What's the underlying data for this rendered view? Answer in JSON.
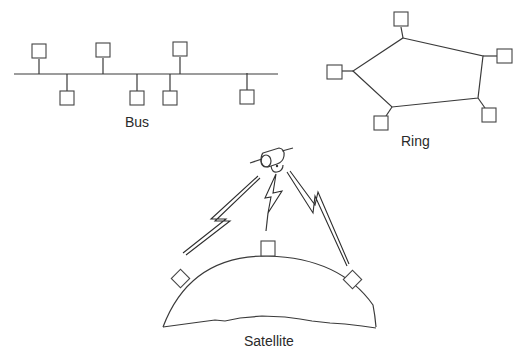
{
  "diagram": {
    "colors": {
      "line": "#3a3a3a",
      "node_stroke": "#444444",
      "background": "#ffffff"
    },
    "bus": {
      "label": "Bus",
      "backbone": {
        "x1": 14,
        "x2": 278,
        "y": 74
      },
      "nodes_above": [
        {
          "x": 39,
          "y": 52
        },
        {
          "x": 103,
          "y": 52
        },
        {
          "x": 180,
          "y": 51
        }
      ],
      "nodes_below": [
        {
          "x": 67,
          "y": 98
        },
        {
          "x": 137,
          "y": 98
        },
        {
          "x": 170,
          "y": 98
        },
        {
          "x": 247,
          "y": 97
        }
      ]
    },
    "ring": {
      "label": "Ring",
      "vertices": [
        {
          "x": 403,
          "y": 38
        },
        {
          "x": 483,
          "y": 56
        },
        {
          "x": 478,
          "y": 98
        },
        {
          "x": 392,
          "y": 107
        },
        {
          "x": 353,
          "y": 71
        }
      ],
      "nodes": [
        {
          "x": 402,
          "y": 19
        },
        {
          "x": 505,
          "y": 56
        },
        {
          "x": 489,
          "y": 115
        },
        {
          "x": 381,
          "y": 123
        },
        {
          "x": 335,
          "y": 72
        }
      ]
    },
    "satellite": {
      "label": "Satellite",
      "satellite_icon": "satellite-icon",
      "ground_nodes": [
        "left-station",
        "top-station",
        "right-station"
      ]
    }
  }
}
